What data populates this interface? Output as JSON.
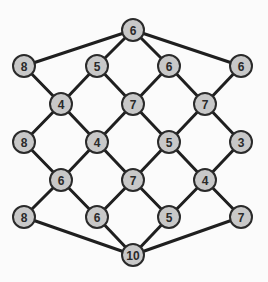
{
  "diagram": {
    "type": "graph",
    "style": {
      "background": "#fbfbfb",
      "node_fill": "#c8c8c8",
      "node_stroke": "#2a2a2a",
      "edge_color": "#1f1f1f",
      "node_radius": 11
    },
    "nodes": [
      {
        "id": "n0",
        "label": "6",
        "x": 133,
        "y": 30
      },
      {
        "id": "n1",
        "label": "8",
        "x": 24,
        "y": 66
      },
      {
        "id": "n2",
        "label": "5",
        "x": 97,
        "y": 66
      },
      {
        "id": "n3",
        "label": "6",
        "x": 169,
        "y": 66
      },
      {
        "id": "n4",
        "label": "6",
        "x": 241,
        "y": 66
      },
      {
        "id": "n5",
        "label": "4",
        "x": 61,
        "y": 104
      },
      {
        "id": "n6",
        "label": "7",
        "x": 133,
        "y": 104
      },
      {
        "id": "n7",
        "label": "7",
        "x": 205,
        "y": 104
      },
      {
        "id": "n8",
        "label": "8",
        "x": 24,
        "y": 142
      },
      {
        "id": "n9",
        "label": "4",
        "x": 97,
        "y": 142
      },
      {
        "id": "n10",
        "label": "5",
        "x": 169,
        "y": 142
      },
      {
        "id": "n11",
        "label": "3",
        "x": 241,
        "y": 142
      },
      {
        "id": "n12",
        "label": "6",
        "x": 61,
        "y": 180
      },
      {
        "id": "n13",
        "label": "7",
        "x": 133,
        "y": 180
      },
      {
        "id": "n14",
        "label": "4",
        "x": 205,
        "y": 180
      },
      {
        "id": "n15",
        "label": "8",
        "x": 24,
        "y": 217
      },
      {
        "id": "n16",
        "label": "6",
        "x": 97,
        "y": 217
      },
      {
        "id": "n17",
        "label": "5",
        "x": 169,
        "y": 217
      },
      {
        "id": "n18",
        "label": "7",
        "x": 241,
        "y": 217
      },
      {
        "id": "n19",
        "label": "10",
        "x": 133,
        "y": 255
      }
    ],
    "edges": [
      [
        "n0",
        "n1"
      ],
      [
        "n0",
        "n2"
      ],
      [
        "n0",
        "n3"
      ],
      [
        "n0",
        "n4"
      ],
      [
        "n1",
        "n5"
      ],
      [
        "n2",
        "n5"
      ],
      [
        "n2",
        "n6"
      ],
      [
        "n3",
        "n6"
      ],
      [
        "n3",
        "n7"
      ],
      [
        "n4",
        "n7"
      ],
      [
        "n5",
        "n8"
      ],
      [
        "n5",
        "n9"
      ],
      [
        "n6",
        "n9"
      ],
      [
        "n6",
        "n10"
      ],
      [
        "n7",
        "n10"
      ],
      [
        "n7",
        "n11"
      ],
      [
        "n8",
        "n12"
      ],
      [
        "n9",
        "n12"
      ],
      [
        "n9",
        "n13"
      ],
      [
        "n10",
        "n13"
      ],
      [
        "n10",
        "n14"
      ],
      [
        "n11",
        "n14"
      ],
      [
        "n12",
        "n15"
      ],
      [
        "n12",
        "n16"
      ],
      [
        "n13",
        "n16"
      ],
      [
        "n13",
        "n17"
      ],
      [
        "n14",
        "n17"
      ],
      [
        "n14",
        "n18"
      ],
      [
        "n15",
        "n19"
      ],
      [
        "n16",
        "n19"
      ],
      [
        "n17",
        "n19"
      ],
      [
        "n18",
        "n19"
      ]
    ]
  }
}
